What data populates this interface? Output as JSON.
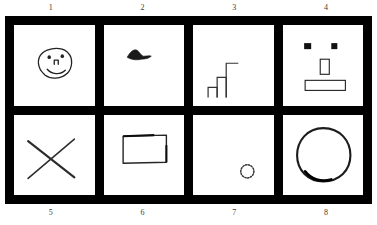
{
  "frame": {
    "border_color": "#000000",
    "panel_color": "#ffffff",
    "ink_color": "#1a1a1a",
    "columns": 4,
    "rows": 2
  },
  "top_labels": [
    "1",
    "2",
    "3",
    "4"
  ],
  "bottom_labels": [
    "5",
    "6",
    "7",
    "8"
  ],
  "panels": [
    {
      "number": "1",
      "position": "top-left",
      "sketch": "smiley-face-oval",
      "description": "Hand-drawn rounded face with two dot eyes, small nose and a smile"
    },
    {
      "number": "2",
      "position": "top-second",
      "sketch": "small-bird",
      "description": "Small solid dark bird or dolphin silhouette near the upper left"
    },
    {
      "number": "3",
      "position": "top-third",
      "sketch": "ascending-bars",
      "description": "Three ascending outlined bars forming a staircase at the lower left"
    },
    {
      "number": "4",
      "position": "top-right",
      "sketch": "blocky-face",
      "description": "Abstract face: two filled square eyes, rectangle nose, wide rectangle mouth"
    },
    {
      "number": "5",
      "position": "bottom-left",
      "sketch": "x-cross",
      "description": "Two crossing diagonal strokes forming an X"
    },
    {
      "number": "6",
      "position": "bottom-second",
      "sketch": "rectangle-outline",
      "description": "Hand-drawn horizontal rectangle outline"
    },
    {
      "number": "7",
      "position": "bottom-third",
      "sketch": "small-dotted-circle",
      "description": "Tiny dotted circle in the lower right area"
    },
    {
      "number": "8",
      "position": "bottom-right",
      "sketch": "large-circle",
      "description": "Large hand-drawn circle outline"
    }
  ]
}
